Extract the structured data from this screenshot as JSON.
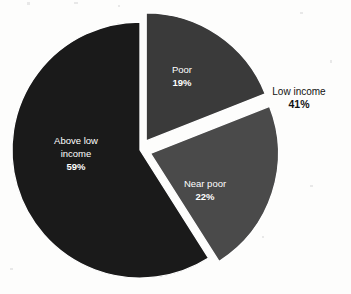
{
  "chart_data": {
    "type": "pie",
    "title": "",
    "subtitle": "",
    "xlabel": "",
    "ylabel": "",
    "legend_position": "none",
    "grid": false,
    "units": "percent",
    "categories": [
      "Poor",
      "Near poor",
      "Above low income"
    ],
    "values": [
      19,
      22,
      59
    ],
    "slices": [
      {
        "label": "Poor",
        "value": 19,
        "value_text": "19%",
        "color": "#3a3a3a",
        "exploded": true,
        "label_color": "#ffffff"
      },
      {
        "label": "Near poor",
        "value": 22,
        "value_text": "22%",
        "color": "#4a4a4a",
        "exploded": true,
        "label_color": "#ffffff"
      },
      {
        "label": "Above low income",
        "label_line_1": "Above low",
        "label_line_2": "income",
        "value": 59,
        "value_text": "59%",
        "color": "#1a1a1a",
        "exploded": false,
        "label_color": "#ffffff"
      }
    ],
    "annotations": [
      {
        "label": "Low income",
        "value": 41,
        "value_text": "41%",
        "covers": [
          "Poor",
          "Near poor"
        ],
        "position": "right-outside",
        "color": "#111111"
      }
    ],
    "background_color": "#fdfdfc",
    "separator_color": "#ffffff"
  },
  "chart": {
    "slice_poor": {
      "name": "Poor",
      "pct": "19%"
    },
    "slice_near_poor": {
      "name": "Near poor",
      "pct": "22%"
    },
    "slice_above_low_income": {
      "name_line1": "Above low",
      "name_line2": "income",
      "pct": "59%"
    },
    "callout_low_income": {
      "name": "Low income",
      "pct": "41%"
    }
  }
}
